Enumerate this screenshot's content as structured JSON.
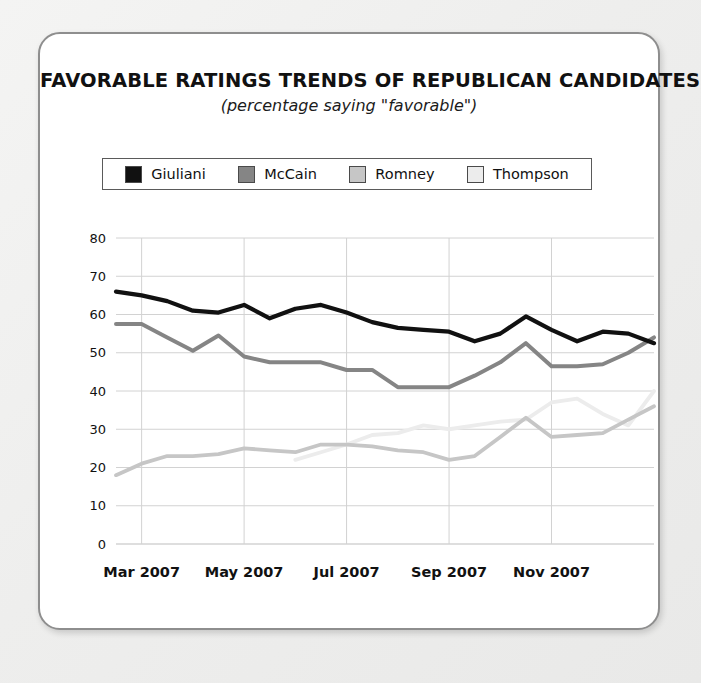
{
  "card": {
    "title": "FAVORABLE RATINGS TRENDS OF REPUBLICAN CANDIDATES",
    "subtitle": "(percentage saying \"favorable\")"
  },
  "legend": {
    "position": "top-inside-box",
    "items": [
      {
        "label": "Giuliani",
        "color": "#111111"
      },
      {
        "label": "McCain",
        "color": "#858585"
      },
      {
        "label": "Romney",
        "color": "#c6c6c6"
      },
      {
        "label": "Thompson",
        "color": "#ececec"
      }
    ]
  },
  "chart_data": {
    "type": "line",
    "title": "FAVORABLE RATINGS TRENDS OF REPUBLICAN CANDIDATES",
    "subtitle": "(percentage saying \"favorable\")",
    "xlabel": "",
    "ylabel": "",
    "ylim": [
      0,
      80
    ],
    "yticks": [
      0,
      10,
      20,
      30,
      40,
      50,
      60,
      70,
      80
    ],
    "ytick_labels": [
      "0",
      "10",
      "20",
      "30",
      "40",
      "50",
      "60",
      "70",
      "80"
    ],
    "grid": true,
    "xtick_labels": [
      "Mar 2007",
      "May 2007",
      "Jul 2007",
      "Sep 2007",
      "Nov 2007"
    ],
    "xtick_positions": [
      1,
      5,
      9,
      13,
      17
    ],
    "x_index_range": [
      0,
      21
    ],
    "x": [
      0,
      1,
      2,
      3,
      4,
      5,
      6,
      7,
      8,
      9,
      10,
      11,
      12,
      13,
      14,
      15,
      16,
      17,
      18,
      19,
      20,
      21
    ],
    "series": [
      {
        "name": "Giuliani",
        "color": "#111111",
        "values": [
          66,
          65,
          63.5,
          61,
          60.5,
          62.5,
          59,
          61.5,
          62.5,
          60.5,
          58,
          56.5,
          56,
          55.5,
          53,
          55,
          59.5,
          56,
          53,
          55.5,
          55,
          52.5
        ]
      },
      {
        "name": "McCain",
        "color": "#858585",
        "values": [
          57.5,
          57.5,
          54,
          50.5,
          54.5,
          49,
          47.5,
          47.5,
          47.5,
          45.5,
          45.5,
          41,
          41,
          41,
          44,
          47.5,
          52.5,
          46.5,
          46.5,
          47,
          50,
          54
        ]
      },
      {
        "name": "Romney",
        "color": "#c6c6c6",
        "values": [
          18,
          21,
          23,
          23,
          23.5,
          25,
          24.5,
          24,
          26,
          26,
          25.5,
          24.5,
          24,
          22,
          23,
          28,
          33,
          28,
          28.5,
          29,
          32.5,
          36
        ]
      },
      {
        "name": "Thompson",
        "color": "#ececec",
        "values": [
          null,
          null,
          null,
          null,
          null,
          null,
          null,
          22,
          24,
          26,
          28.5,
          29,
          31,
          30,
          31,
          32,
          32.5,
          37,
          38,
          34,
          31,
          40
        ]
      }
    ]
  }
}
